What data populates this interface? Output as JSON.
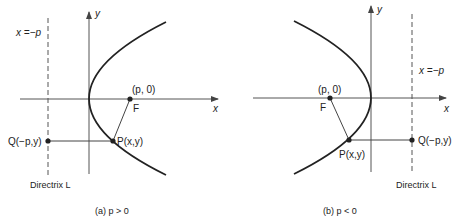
{
  "figures": [
    {
      "id": "a",
      "caption": "(a)  p  >  0",
      "axis_x_label": "x",
      "axis_y_label": "y",
      "directrix_eq": "x =−p",
      "directrix_label": "Directrix L",
      "focus_coord": "(p, 0)",
      "focus_label": "F",
      "point_p": "P(x,y)",
      "point_q": "Q(−p,y)"
    },
    {
      "id": "b",
      "caption": "(b)  p  <  0",
      "axis_x_label": "x",
      "axis_y_label": "y",
      "directrix_eq": "x =−p",
      "directrix_label": "Directrix L",
      "focus_coord": "(p, 0)",
      "focus_label": "F",
      "point_p": "P(x,y)",
      "point_q": "Q(−p,y)"
    }
  ],
  "colors": {
    "ink": "#222222",
    "axis": "#555555",
    "background": "#ffffff"
  }
}
